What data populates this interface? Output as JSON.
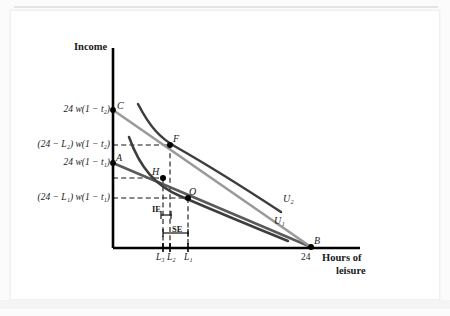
{
  "figure": {
    "axes": {
      "y_label": "Income",
      "x_label_line1": "Hours of",
      "x_label_line2": "leisure"
    },
    "y_tick_labels": [
      {
        "id": "c_intercept",
        "text": "24 w(1 − t₂)"
      },
      {
        "id": "f_income",
        "text": "(24 − L₂) w(1 − t₂)"
      },
      {
        "id": "a_intercept",
        "text": "24 w(1 − t₁)"
      },
      {
        "id": "o_income",
        "text": "(24 − L₁) w(1 − t₁)"
      }
    ],
    "x_tick_labels": [
      {
        "id": "l3",
        "text": "L₃"
      },
      {
        "id": "l2",
        "text": "L₂"
      },
      {
        "id": "l1",
        "text": "L₁"
      },
      {
        "id": "t24",
        "text": "24"
      }
    ],
    "points": [
      {
        "id": "C",
        "text": "C"
      },
      {
        "id": "F",
        "text": "F"
      },
      {
        "id": "A",
        "text": "A"
      },
      {
        "id": "H",
        "text": "H"
      },
      {
        "id": "O",
        "text": "O"
      },
      {
        "id": "B",
        "text": "B"
      }
    ],
    "curves": [
      {
        "id": "U1",
        "text": "U₁"
      },
      {
        "id": "U2",
        "text": "U₂"
      }
    ],
    "effects": [
      {
        "id": "IE",
        "text": "IE"
      },
      {
        "id": "SE",
        "text": "SE"
      }
    ],
    "colors": {
      "axis": "#000000",
      "budget_line_high": "#8c8c8c",
      "budget_line_low": "#5a5a5a",
      "indifference_curve": "#3d3d3d",
      "dashed_guide": "#111111",
      "point_marker": "#000000",
      "frame": "#f0f0f0"
    }
  }
}
